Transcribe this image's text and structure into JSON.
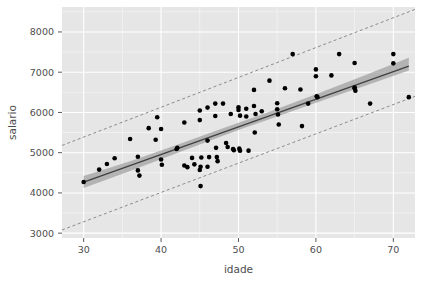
{
  "chart_data": {
    "type": "scatter",
    "title": "",
    "subtitle": "",
    "xlabel": "idade",
    "ylabel": "salario",
    "xlim": [
      27.2,
      72.8
    ],
    "ylim": [
      2880,
      8620
    ],
    "xticks": [
      30,
      40,
      50,
      60,
      70
    ],
    "yticks": [
      3000,
      4000,
      5000,
      6000,
      7000,
      8000
    ],
    "xtick_labels": [
      "30",
      "40",
      "50",
      "60",
      "70"
    ],
    "ytick_labels": [
      "3000",
      "4000",
      "5000",
      "6000",
      "7000",
      "8000"
    ],
    "grid": true,
    "grid_color": "#ffffff",
    "panel_color": "#e6e6e6",
    "legend": "none",
    "point_color": "#000000",
    "point_size": 2.3,
    "fit_line": {
      "name": "regressao linear",
      "color": "#404040",
      "style": "solid",
      "x": [
        30,
        72
      ],
      "y": [
        4270,
        7150
      ],
      "slope": 68.6,
      "intercept": 2212
    },
    "confidence_band": {
      "name": "intervalo de confianca",
      "color": "#a0a0a0",
      "x": [
        30,
        36,
        42,
        48,
        51,
        54,
        60,
        66,
        72
      ],
      "upper": [
        4420,
        4790,
        5190,
        5605,
        5810,
        6020,
        6450,
        6900,
        7360
      ],
      "lower": [
        4120,
        4545,
        4985,
        5420,
        5630,
        5830,
        6240,
        6640,
        7040
      ]
    },
    "prediction_upper": {
      "name": "limite superior de predicao",
      "color": "#808080",
      "style": "dashed",
      "x": [
        27.2,
        72.8
      ],
      "y": [
        5180,
        8560
      ]
    },
    "prediction_lower": {
      "name": "limite inferior de predicao",
      "color": "#808080",
      "style": "dashed",
      "x": [
        27.2,
        72.8
      ],
      "y": [
        3080,
        6400
      ]
    },
    "points": [
      [
        30.0,
        4270
      ],
      [
        32.0,
        4580
      ],
      [
        33.0,
        4720
      ],
      [
        34.0,
        4860
      ],
      [
        36.0,
        5340
      ],
      [
        37.0,
        4900
      ],
      [
        37.0,
        4560
      ],
      [
        37.2,
        4430
      ],
      [
        38.4,
        5610
      ],
      [
        39.3,
        5320
      ],
      [
        39.5,
        5880
      ],
      [
        40.0,
        5590
      ],
      [
        40.0,
        4830
      ],
      [
        40.1,
        4700
      ],
      [
        42.0,
        5090
      ],
      [
        42.1,
        5120
      ],
      [
        43.0,
        5750
      ],
      [
        43.0,
        4680
      ],
      [
        43.4,
        4640
      ],
      [
        44.0,
        4870
      ],
      [
        44.3,
        4710
      ],
      [
        45.0,
        6050
      ],
      [
        45.0,
        5810
      ],
      [
        45.2,
        4880
      ],
      [
        45.1,
        4650
      ],
      [
        45.0,
        4570
      ],
      [
        45.1,
        4170
      ],
      [
        46.0,
        6120
      ],
      [
        46.0,
        5300
      ],
      [
        46.2,
        4890
      ],
      [
        46.0,
        4650
      ],
      [
        47.0,
        6220
      ],
      [
        47.0,
        5910
      ],
      [
        47.1,
        5120
      ],
      [
        47.2,
        4890
      ],
      [
        47.3,
        4790
      ],
      [
        48.0,
        6220
      ],
      [
        48.4,
        5240
      ],
      [
        48.6,
        5140
      ],
      [
        49.0,
        5960
      ],
      [
        49.3,
        5090
      ],
      [
        49.4,
        5060
      ],
      [
        50.0,
        6130
      ],
      [
        50.0,
        6060
      ],
      [
        50.2,
        5920
      ],
      [
        50.1,
        5100
      ],
      [
        50.2,
        5050
      ],
      [
        51.0,
        6090
      ],
      [
        51.0,
        5900
      ],
      [
        51.3,
        5050
      ],
      [
        52.0,
        6560
      ],
      [
        52.0,
        6160
      ],
      [
        52.2,
        5960
      ],
      [
        52.1,
        5500
      ],
      [
        53.0,
        6030
      ],
      [
        54.0,
        6790
      ],
      [
        55.0,
        6230
      ],
      [
        55.0,
        6080
      ],
      [
        55.1,
        5950
      ],
      [
        55.2,
        5700
      ],
      [
        56.0,
        6600
      ],
      [
        57.0,
        7450
      ],
      [
        58.0,
        6570
      ],
      [
        58.2,
        5660
      ],
      [
        59.0,
        6220
      ],
      [
        60.0,
        7070
      ],
      [
        60.0,
        6900
      ],
      [
        60.1,
        6400
      ],
      [
        60.2,
        6380
      ],
      [
        62.0,
        6920
      ],
      [
        63.0,
        7450
      ],
      [
        65.0,
        7230
      ],
      [
        65.0,
        6620
      ],
      [
        65.0,
        6600
      ],
      [
        65.1,
        6540
      ],
      [
        67.0,
        6220
      ],
      [
        70.0,
        7450
      ],
      [
        70.0,
        7220
      ],
      [
        72.0,
        6380
      ]
    ]
  }
}
